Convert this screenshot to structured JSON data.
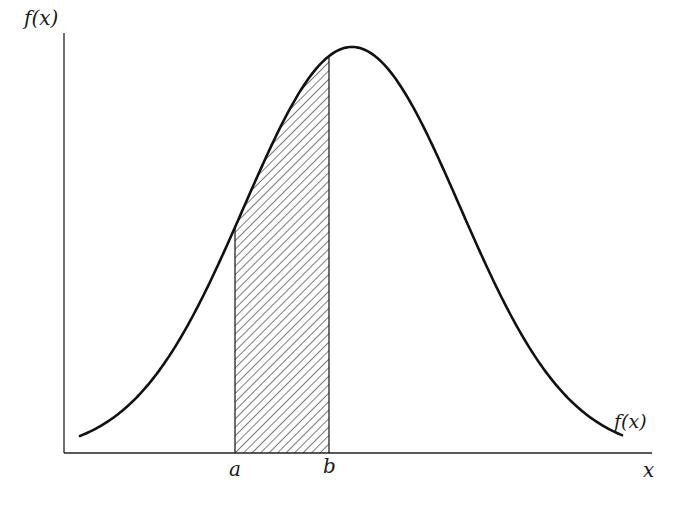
{
  "chart_data": {
    "type": "area",
    "title": "",
    "ylabel": "f(x)",
    "xlabel": "x",
    "curve_label": "f(x)",
    "x_ticks": [
      "a",
      "b"
    ],
    "shaded_region": {
      "from": "a",
      "to": "b",
      "pattern": "diagonal-hatch"
    },
    "grid": false,
    "legend": false,
    "geometry": {
      "origin_px": [
        64,
        453
      ],
      "x_axis_end_px": 652,
      "y_axis_top_px": 33,
      "curve_center_px": 352,
      "curve_peak_y_px": 47,
      "curve_sigma_px": 108,
      "curve_x_start_px": 80,
      "curve_x_end_px": 622,
      "a_px": 235,
      "b_px": 329
    }
  },
  "labels": {
    "y_axis": "f(x)",
    "x_axis": "x",
    "curve": "f(x)",
    "a": "a",
    "b": "b"
  },
  "colors": {
    "line": "#111111",
    "background": "#ffffff"
  }
}
